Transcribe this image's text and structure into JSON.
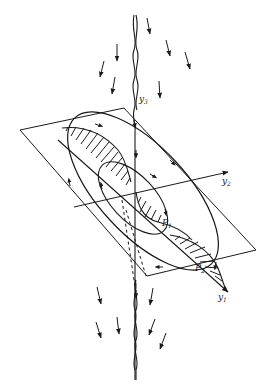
{
  "figure": {
    "colors": {
      "ink": "#1a1a1a",
      "background": "#ffffff"
    },
    "labels": {
      "axis_y1": "y",
      "axis_y1_sub": "1",
      "axis_y2": "y",
      "axis_y2_sub": "2",
      "axis_y3": "y",
      "axis_y3_sub": "3",
      "point_p1": "P",
      "point_p1_sub": "1",
      "point_p2": "P",
      "point_p2_sub": "2"
    },
    "elements": [
      "vortex-axis-y3",
      "tilted-plane",
      "axis-y1",
      "axis-y2",
      "outer-ellipse-trajectory",
      "inner-ellipse-trajectory",
      "upper-hatched-velocity-profile",
      "lower-hatched-velocity-profile",
      "flow-arrows-above",
      "flow-arrows-below"
    ]
  }
}
